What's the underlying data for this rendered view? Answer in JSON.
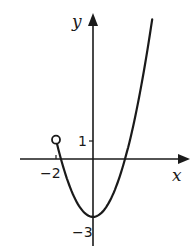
{
  "chart_data": {
    "type": "line",
    "title": "",
    "xlabel": "x",
    "ylabel": "y",
    "function": "y = x^2 - 3",
    "domain": "x > -2",
    "xlim": [
      -2.5,
      3.2
    ],
    "ylim": [
      -3.2,
      7.5
    ],
    "grid": false,
    "legend": null,
    "x_tick_labels": [
      "-2"
    ],
    "y_tick_labels": [
      "1",
      "-3"
    ],
    "annotations": [
      {
        "type": "open-circle",
        "x": -2,
        "y": 1,
        "note": "endpoint excluded"
      },
      {
        "type": "vertex",
        "x": 0,
        "y": -3
      }
    ],
    "series": [
      {
        "name": "parabola",
        "x": [
          -2,
          -1.5,
          -1,
          -0.5,
          0,
          0.5,
          1,
          1.5,
          1.732,
          2,
          2.5,
          3,
          3.2
        ],
        "y": [
          1,
          -0.75,
          -2,
          -2.75,
          -3,
          -2.75,
          -2,
          -0.75,
          0,
          1,
          3.25,
          6,
          7.24
        ]
      }
    ]
  },
  "labels": {
    "y_axis": "y",
    "x_axis": "x",
    "tick_one": "1",
    "tick_neg_two": "−2",
    "tick_neg_three": "−3"
  },
  "colors": {
    "ink": "#1a1a1a",
    "background": "#ffffff"
  }
}
